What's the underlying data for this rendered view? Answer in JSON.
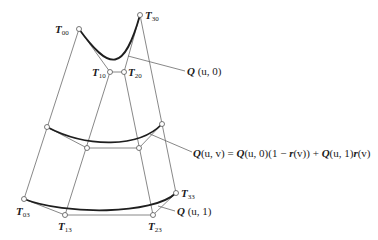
{
  "diagram": {
    "colors": {
      "line": "#6a6a6a",
      "curve": "#1e1e1e",
      "point_fill": "#ffffff",
      "text": "#1a1a1a"
    },
    "control_points": [
      {
        "id": "T00",
        "base": "T",
        "sub": "00",
        "x": 79,
        "y": 29,
        "label_x": 55,
        "label_y": 33
      },
      {
        "id": "T10",
        "base": "T",
        "sub": "10",
        "x": 110,
        "y": 72,
        "label_x": 92,
        "label_y": 76
      },
      {
        "id": "T20",
        "base": "T",
        "sub": "20",
        "x": 124,
        "y": 72,
        "label_x": 128,
        "label_y": 76
      },
      {
        "id": "T30",
        "base": "T",
        "sub": "30",
        "x": 140,
        "y": 15,
        "label_x": 145,
        "label_y": 19
      },
      {
        "id": "T03",
        "base": "T",
        "sub": "03",
        "x": 24,
        "y": 199,
        "label_x": 16,
        "label_y": 215
      },
      {
        "id": "T13",
        "base": "T",
        "sub": "13",
        "x": 65,
        "y": 215,
        "label_x": 58,
        "label_y": 230
      },
      {
        "id": "T23",
        "base": "T",
        "sub": "23",
        "x": 153,
        "y": 215,
        "label_x": 148,
        "label_y": 230
      },
      {
        "id": "T33",
        "base": "T",
        "sub": "33",
        "x": 176,
        "y": 193,
        "label_x": 181,
        "label_y": 197
      }
    ],
    "mid_points": [
      {
        "id": "M0",
        "x": 47,
        "y": 127
      },
      {
        "id": "M1",
        "x": 87,
        "y": 148
      },
      {
        "id": "M2",
        "x": 139,
        "y": 148
      },
      {
        "id": "M3",
        "x": 162,
        "y": 124
      }
    ],
    "labels": {
      "q_u0": {
        "bold": "Q",
        "rest": " (u, 0)"
      },
      "q_uv": {
        "bold1": "Q",
        "part1": "(u, v) = ",
        "bold2": "Q",
        "part2": "(u, 0)(1 − ",
        "bold3": "r",
        "part3": "(v)) + ",
        "bold4": "Q",
        "part4": "(u, 1)",
        "bold5": "r",
        "part5": "(v)"
      },
      "q_u1": {
        "bold": "Q",
        "rest": " (u, 1)"
      }
    }
  }
}
